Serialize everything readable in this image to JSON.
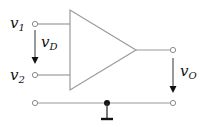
{
  "diagram": {
    "type": "op-amp differential amplifier symbol",
    "labels": {
      "v1": {
        "main": "v",
        "sub": "1"
      },
      "v2": {
        "main": "v",
        "sub": "2"
      },
      "vD": {
        "main": "v",
        "sub": "D"
      },
      "vO": {
        "main": "v",
        "sub": "O"
      }
    },
    "components": [
      "amplifier-triangle",
      "input-terminal-v1",
      "input-terminal-v2",
      "output-terminal",
      "ground-rail",
      "ground-symbol"
    ],
    "colors": {
      "wire": "#9a9a9a",
      "text": "#111111",
      "node": "#111111"
    }
  }
}
